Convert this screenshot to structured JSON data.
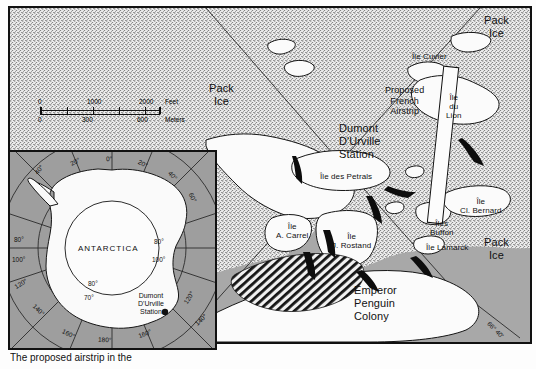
{
  "figure": {
    "type": "map",
    "caption_partial": "The proposed airstrip in the"
  },
  "scale_bar": {
    "feet": {
      "ticks": [
        "0",
        "1000",
        "2000"
      ],
      "unit_label": "Feet"
    },
    "meters": {
      "ticks": [
        "0",
        "300",
        "600"
      ],
      "unit_label": "Meters"
    }
  },
  "main_map": {
    "labels": [
      {
        "name": "pack-ice-left",
        "text": "Pack\nIce",
        "x": 207,
        "y": 82,
        "size": "big"
      },
      {
        "name": "pack-ice-top-right",
        "text": "Pack\nIce",
        "x": 482,
        "y": 14,
        "size": "big"
      },
      {
        "name": "pack-ice-right",
        "text": "Pack\nIce",
        "x": 482,
        "y": 236,
        "size": "big"
      },
      {
        "name": "dumont-durville-station",
        "text": "Dumont\nD'Urville\nStation",
        "x": 337,
        "y": 122,
        "size": "big"
      },
      {
        "name": "proposed-french-airstrip",
        "text": "Proposed\nFrench\nAirstrip",
        "x": 383,
        "y": 85,
        "size": "mid"
      },
      {
        "name": "ile-cuvier",
        "text": "Île Cuvier",
        "x": 410,
        "y": 52,
        "size": "small"
      },
      {
        "name": "ile-du-lion",
        "text": "Île\ndu\nLion",
        "x": 444,
        "y": 93,
        "size": "small"
      },
      {
        "name": "ile-des-petrals",
        "text": "Île des Petrals",
        "x": 318,
        "y": 172,
        "size": "small"
      },
      {
        "name": "ile-a-carrel",
        "text": "Île\nA. Carrel",
        "x": 274,
        "y": 222,
        "size": "small"
      },
      {
        "name": "ile-j-rostand",
        "text": "Île\nJ. Rostand",
        "x": 330,
        "y": 232,
        "size": "small"
      },
      {
        "name": "ile-cl-bernard",
        "text": "Île\nCl. Bernard",
        "x": 458,
        "y": 197,
        "size": "small"
      },
      {
        "name": "iles-buffon",
        "text": "Îles\nBuffon",
        "x": 428,
        "y": 219,
        "size": "small"
      },
      {
        "name": "ile-lamarck",
        "text": "Île Lamarck",
        "x": 424,
        "y": 243,
        "size": "small"
      },
      {
        "name": "emperor-penguin-colony",
        "text": "Emperor\nPenguin\nColony",
        "x": 352,
        "y": 284,
        "size": "big"
      }
    ],
    "coordinates": [
      {
        "name": "coord-bottom-right",
        "text": "66° 40'",
        "x": 489,
        "y": 320
      }
    ],
    "legend": {
      "symbol": "migration-arrow",
      "text": "Penguin  Migration\nRoutes"
    }
  },
  "inset_map": {
    "title": "ANTARCTICA",
    "station_label": "Dumont\nD'Urville\nStation",
    "longitude_labels": [
      "40°",
      "20°",
      "0°",
      "20°",
      "40°",
      "60°",
      "80°",
      "100°",
      "120°",
      "140°",
      "160°",
      "180°",
      "160°",
      "140°",
      "120°",
      "100°",
      "80°",
      "60°"
    ],
    "latitude_labels": [
      "70°",
      "80°"
    ]
  },
  "colors": {
    "sea": "#a8a8a8",
    "pack_ice": "#e9e9e9",
    "land": "#fbfbfb",
    "ink": "#111111",
    "inset_ocean": "#9e9e9e"
  }
}
